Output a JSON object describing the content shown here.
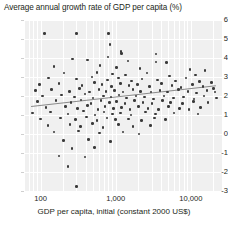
{
  "chart_data": {
    "type": "scatter",
    "title": "Average annual growth rate of GDP per capita (%)",
    "xlabel": "GDP per capita, initial (constant 2000 US$)",
    "ylabel": "",
    "xscale": "log",
    "xlim": [
      60,
      26000
    ],
    "ylim": [
      -3,
      6
    ],
    "grid": true,
    "legend": "none",
    "xticks": [
      {
        "value": 100,
        "label": "100"
      },
      {
        "value": 1000,
        "label": "1,000"
      },
      {
        "value": 10000,
        "label": "10,000"
      }
    ],
    "yticks": [
      {
        "value": 6,
        "label": "6"
      },
      {
        "value": 5,
        "label": "5"
      },
      {
        "value": 4,
        "label": "4"
      },
      {
        "value": 3,
        "label": "3"
      },
      {
        "value": 2,
        "label": "2"
      },
      {
        "value": 1,
        "label": "1"
      },
      {
        "value": 0,
        "label": "0"
      },
      {
        "value": -1,
        "label": "-1"
      },
      {
        "value": -2,
        "label": "-2"
      },
      {
        "value": -3,
        "label": "-3"
      }
    ],
    "trendline": {
      "type": "linear-on-log-x",
      "x_start": 75,
      "y_start": 1.45,
      "x_end": 22000,
      "y_end": 2.55,
      "color": "#8a8a8a"
    },
    "series": [
      {
        "name": "Countries",
        "marker": "circle",
        "color": "#3a3a3a",
        "points": [
          [
            112,
            5.3
          ],
          [
            300,
            5.3
          ],
          [
            800,
            5.3
          ],
          [
            840,
            4.7
          ],
          [
            1180,
            4.35
          ],
          [
            1190,
            4.25
          ],
          [
            790,
            4.05
          ],
          [
            265,
            3.95
          ],
          [
            420,
            3.9
          ],
          [
            1450,
            3.85
          ],
          [
            3450,
            4.2
          ],
          [
            3450,
            3.8
          ],
          [
            4700,
            3.75
          ],
          [
            150,
            3.55
          ],
          [
            620,
            3.6
          ],
          [
            1020,
            3.5
          ],
          [
            2100,
            3.45
          ],
          [
            9800,
            3.4
          ],
          [
            15500,
            3.35
          ],
          [
            205,
            3.2
          ],
          [
            560,
            3.25
          ],
          [
            900,
            3.15
          ],
          [
            1350,
            3.1
          ],
          [
            2600,
            3.2
          ],
          [
            5200,
            3.05
          ],
          [
            11500,
            3.1
          ],
          [
            128,
            2.95
          ],
          [
            300,
            2.9
          ],
          [
            480,
            3.0
          ],
          [
            770,
            2.85
          ],
          [
            1080,
            2.95
          ],
          [
            1620,
            2.8
          ],
          [
            2250,
            2.9
          ],
          [
            3600,
            2.85
          ],
          [
            6200,
            2.8
          ],
          [
            8600,
            2.95
          ],
          [
            13000,
            2.75
          ],
          [
            19000,
            2.7
          ],
          [
            96,
            2.6
          ],
          [
            175,
            2.65
          ],
          [
            355,
            2.55
          ],
          [
            520,
            2.7
          ],
          [
            660,
            2.6
          ],
          [
            880,
            2.5
          ],
          [
            1150,
            2.65
          ],
          [
            1500,
            2.55
          ],
          [
            1950,
            2.6
          ],
          [
            2800,
            2.5
          ],
          [
            4100,
            2.65
          ],
          [
            5600,
            2.55
          ],
          [
            7400,
            2.45
          ],
          [
            10500,
            2.6
          ],
          [
            14500,
            2.5
          ],
          [
            20000,
            2.4
          ],
          [
            85,
            2.3
          ],
          [
            140,
            2.35
          ],
          [
            240,
            2.25
          ],
          [
            330,
            2.4
          ],
          [
            450,
            2.2
          ],
          [
            600,
            2.35
          ],
          [
            740,
            2.25
          ],
          [
            960,
            2.3
          ],
          [
            1250,
            2.2
          ],
          [
            1700,
            2.35
          ],
          [
            2150,
            2.25
          ],
          [
            2950,
            2.2
          ],
          [
            3900,
            2.3
          ],
          [
            4900,
            2.2
          ],
          [
            6800,
            2.35
          ],
          [
            9200,
            2.25
          ],
          [
            12000,
            2.15
          ],
          [
            16500,
            2.3
          ],
          [
            21000,
            2.2
          ],
          [
            105,
            2.0
          ],
          [
            190,
            2.05
          ],
          [
            280,
            1.95
          ],
          [
            390,
            2.1
          ],
          [
            500,
            1.9
          ],
          [
            690,
            2.0
          ],
          [
            860,
            1.95
          ],
          [
            1100,
            2.05
          ],
          [
            1400,
            1.9
          ],
          [
            1850,
            2.0
          ],
          [
            2400,
            1.95
          ],
          [
            3200,
            1.85
          ],
          [
            4400,
            2.0
          ],
          [
            5900,
            1.9
          ],
          [
            8000,
            1.95
          ],
          [
            11000,
            1.85
          ],
          [
            15000,
            2.0
          ],
          [
            22000,
            1.9
          ],
          [
            90,
            1.7
          ],
          [
            160,
            1.75
          ],
          [
            255,
            1.65
          ],
          [
            345,
            1.8
          ],
          [
            470,
            1.6
          ],
          [
            640,
            1.75
          ],
          [
            820,
            1.65
          ],
          [
            1030,
            1.7
          ],
          [
            1320,
            1.6
          ],
          [
            1780,
            1.75
          ],
          [
            2300,
            1.65
          ],
          [
            3050,
            1.6
          ],
          [
            4200,
            1.75
          ],
          [
            5400,
            1.65
          ],
          [
            7800,
            1.6
          ],
          [
            10800,
            1.7
          ],
          [
            17000,
            1.65
          ],
          [
            118,
            1.4
          ],
          [
            215,
            1.45
          ],
          [
            310,
            1.35
          ],
          [
            420,
            1.5
          ],
          [
            580,
            1.3
          ],
          [
            720,
            1.45
          ],
          [
            940,
            1.35
          ],
          [
            1200,
            1.4
          ],
          [
            1550,
            1.3
          ],
          [
            2000,
            1.45
          ],
          [
            2700,
            1.35
          ],
          [
            3700,
            1.3
          ],
          [
            5000,
            1.45
          ],
          [
            7000,
            1.35
          ],
          [
            9500,
            1.3
          ],
          [
            13500,
            1.4
          ],
          [
            78,
            1.1
          ],
          [
            135,
            1.15
          ],
          [
            230,
            1.05
          ],
          [
            370,
            1.2
          ],
          [
            530,
            1.0
          ],
          [
            700,
            1.15
          ],
          [
            900,
            1.05
          ],
          [
            1160,
            1.1
          ],
          [
            1600,
            1.0
          ],
          [
            2500,
            1.15
          ],
          [
            3400,
            1.05
          ],
          [
            6000,
            1.1
          ],
          [
            12500,
            1.05
          ],
          [
            100,
            0.8
          ],
          [
            185,
            0.85
          ],
          [
            290,
            0.75
          ],
          [
            410,
            0.9
          ],
          [
            560,
            0.7
          ],
          [
            760,
            0.85
          ],
          [
            1000,
            0.75
          ],
          [
            1480,
            0.8
          ],
          [
            2200,
            0.7
          ],
          [
            3300,
            0.85
          ],
          [
            4600,
            0.75
          ],
          [
            125,
            0.45
          ],
          [
            245,
            0.5
          ],
          [
            340,
            0.4
          ],
          [
            490,
            0.55
          ],
          [
            680,
            0.35
          ],
          [
            1090,
            0.5
          ],
          [
            1700,
            0.4
          ],
          [
            2900,
            0.45
          ],
          [
            150,
            0.1
          ],
          [
            320,
            0.15
          ],
          [
            610,
            0.05
          ],
          [
            1250,
            0.1
          ],
          [
            2050,
            0.0
          ],
          [
            200,
            -0.35
          ],
          [
            430,
            -0.3
          ],
          [
            850,
            -0.4
          ],
          [
            260,
            -0.75
          ],
          [
            520,
            -0.7
          ],
          [
            175,
            -1.15
          ],
          [
            390,
            -1.2
          ],
          [
            230,
            -1.7
          ],
          [
            300,
            -2.75
          ]
        ]
      }
    ]
  }
}
